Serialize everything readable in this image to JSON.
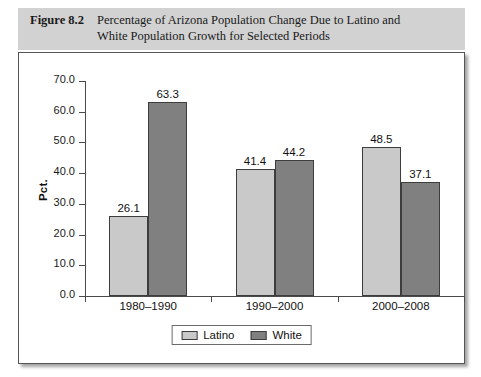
{
  "figure": {
    "label": "Figure 8.2",
    "title_line1": "Percentage of Arizona Population Change Due to Latino and",
    "title_line2": "White Population Growth for Selected Periods"
  },
  "chart_data": {
    "type": "bar",
    "title": "Percentage of Arizona Population Change Due to Latino and White Population Growth for Selected Periods",
    "xlabel": "",
    "ylabel": "Pct.",
    "ylim": [
      0.0,
      70.0
    ],
    "ytick_labels": [
      "0.0",
      "10.0",
      "20.0",
      "30.0",
      "40.0",
      "50.0",
      "60.0",
      "70.0"
    ],
    "yticks": [
      0.0,
      10.0,
      20.0,
      30.0,
      40.0,
      50.0,
      60.0,
      70.0
    ],
    "grid": false,
    "legend_position": "bottom",
    "categories": [
      "1980–1990",
      "1990–2000",
      "2000–2008"
    ],
    "series": [
      {
        "name": "Latino",
        "color": "#c9c9c9",
        "values": [
          26.1,
          41.4,
          48.5
        ],
        "labels": [
          "26.1",
          "41.4",
          "48.5"
        ]
      },
      {
        "name": "White",
        "color": "#808080",
        "values": [
          63.3,
          44.2,
          37.1
        ],
        "labels": [
          "63.3",
          "44.2",
          "37.1"
        ]
      }
    ]
  },
  "colors": {
    "latino": "#c9c9c9",
    "white": "#808080",
    "bar_border": "#3d3d3d",
    "axis": "#4a4a4a",
    "header_band": "#d2d2d2",
    "frame_border": "#555555"
  }
}
